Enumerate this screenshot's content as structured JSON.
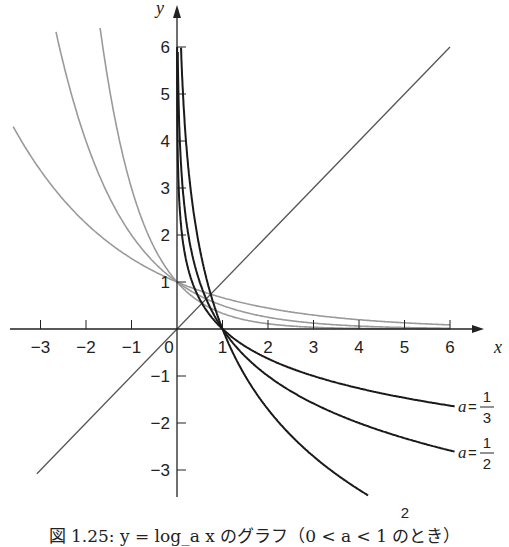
{
  "caption": "図 1.25: y = log_a x のグラフ（0 < a < 1 のとき）",
  "colors": {
    "log_curve": "#1a1a1a",
    "exp_curve": "#9a9a9a",
    "identity_line": "#555555",
    "axis": "#222222"
  },
  "chart_data": {
    "type": "line",
    "title": "図 1.25: y = log_a x のグラフ（0 < a < 1 のとき）",
    "xlabel": "x",
    "ylabel": "y",
    "xlim": [
      -3.6,
      6.8
    ],
    "ylim": [
      -3.6,
      6.9
    ],
    "x_ticks": [
      -3,
      -2,
      -1,
      0,
      1,
      2,
      3,
      4,
      5,
      6
    ],
    "y_ticks": [
      -3,
      -2,
      -1,
      1,
      2,
      3,
      4,
      5,
      6
    ],
    "grid": false,
    "series": [
      {
        "name": "a=1/3",
        "kind": "log",
        "base": 0.3333,
        "color": "#1a1a1a",
        "label_num": "1",
        "label_den": "3",
        "x_range": [
          0.0,
          6.1
        ]
      },
      {
        "name": "a=1/2",
        "kind": "log",
        "base": 0.5,
        "color": "#1a1a1a",
        "label_num": "1",
        "label_den": "2",
        "x_range": [
          0.0,
          6.1
        ]
      },
      {
        "name": "a=2/3",
        "kind": "log",
        "base": 0.6667,
        "color": "#1a1a1a",
        "label_num": "2",
        "label_den": "3",
        "x_range": [
          0.0,
          4.2
        ]
      },
      {
        "name": "y=(1/3)^x",
        "kind": "exp",
        "base": 0.3333,
        "color": "#9a9a9a",
        "x_range": [
          -1.69,
          6.0
        ]
      },
      {
        "name": "y=(1/2)^x",
        "kind": "exp",
        "base": 0.5,
        "color": "#9a9a9a",
        "x_range": [
          -2.66,
          6.0
        ]
      },
      {
        "name": "y=(2/3)^x",
        "kind": "exp",
        "base": 0.6667,
        "color": "#9a9a9a",
        "x_range": [
          -3.6,
          6.0
        ]
      },
      {
        "name": "y=x",
        "kind": "identity",
        "color": "#555555",
        "x_range": [
          -3.08,
          6.0
        ]
      }
    ],
    "annotations": [
      {
        "text": "a=1/3",
        "near": [
          6.1,
          -1.64
        ]
      },
      {
        "text": "a=1/2",
        "near": [
          6.1,
          -2.6
        ]
      },
      {
        "text": "a=2/3",
        "near": [
          4.2,
          -3.54
        ]
      }
    ],
    "legend": "none (inline labels)"
  }
}
